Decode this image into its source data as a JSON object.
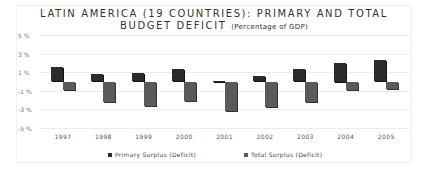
{
  "chart_data": {
    "type": "bar",
    "title": "LATIN AMERICA (19 COUNTRIES): PRIMARY AND TOTAL BUDGET DEFICIT",
    "title_line1": "LATIN AMERICA (19 COUNTRIES): PRIMARY AND TOTAL",
    "title_line2": "BUDGET DEFICIT",
    "subtitle": "(Percentage of GDP)",
    "xlabel": "",
    "ylabel": "",
    "ylim": [
      -5,
      5
    ],
    "yticks": [
      "5 %",
      "3 %",
      "1 %",
      "-1 %",
      "-3 %",
      "-5 %"
    ],
    "ytick_values": [
      5,
      3,
      1,
      -1,
      -3,
      -5
    ],
    "grid": true,
    "legend_position": "bottom",
    "categories": [
      "1997",
      "1998",
      "1999",
      "2000",
      "2001",
      "2002",
      "2003",
      "2004",
      "2005"
    ],
    "series": [
      {
        "name": "Primary Surplus (Deficit)",
        "color": "#2b2b2b",
        "values": [
          1.6,
          0.8,
          0.9,
          1.3,
          0.1,
          0.6,
          1.3,
          2.0,
          2.3
        ]
      },
      {
        "name": "Total Surplus (Deficit)",
        "color": "#5a5a5a",
        "values": [
          -0.9,
          -2.2,
          -2.6,
          -2.1,
          -3.2,
          -2.8,
          -2.2,
          -0.9,
          -0.8
        ]
      }
    ]
  }
}
